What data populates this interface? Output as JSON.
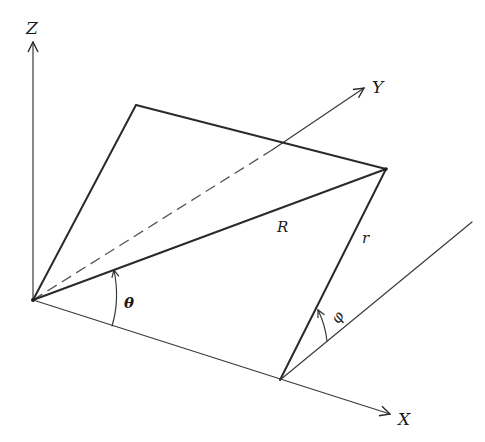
{
  "diagram": {
    "type": "3d-geometry-projection",
    "axes": {
      "z": {
        "label": "Z"
      },
      "y": {
        "label": "Y"
      },
      "x": {
        "label": "X"
      }
    },
    "labels": {
      "R": "R",
      "r": "r",
      "theta": "θ",
      "phi": "φ"
    },
    "colors": {
      "line": "#2a2a2a",
      "background": "#ffffff"
    },
    "points": {
      "origin": [
        33,
        300
      ],
      "plane_top_corner": [
        136,
        105
      ],
      "far_corner": [
        386,
        169
      ],
      "base_corner": [
        280,
        380
      ]
    }
  }
}
